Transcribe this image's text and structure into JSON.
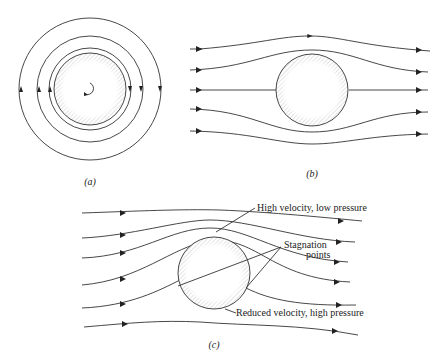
{
  "figure": {
    "panels": [
      {
        "id": "a",
        "caption": "(a)",
        "description": "Circulating flow around a cylinder (pure circulation)"
      },
      {
        "id": "b",
        "caption": "(b)",
        "description": "Uniform flow around a non-rotating cylinder"
      },
      {
        "id": "c",
        "caption": "(c)",
        "description": "Combined uniform flow and circulation (Magnus effect)"
      }
    ],
    "labels": {
      "high_velocity": "High velocity, low pressure",
      "stagnation_1": "Stagnation",
      "stagnation_2": "points",
      "reduced_velocity": "Reduced velocity, high pressure"
    },
    "colors": {
      "stroke": "#333333",
      "hatch": "#999999",
      "background": "#ffffff"
    }
  }
}
